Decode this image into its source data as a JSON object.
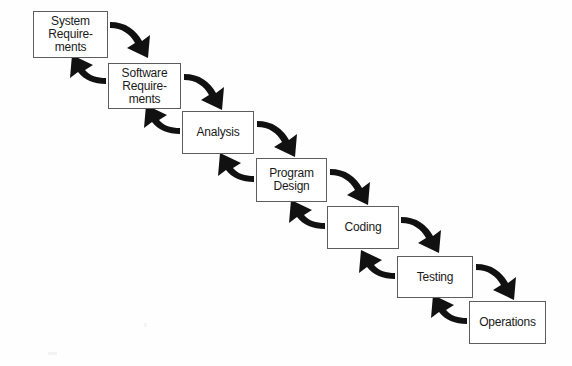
{
  "diagram": {
    "type": "waterfall-model-flowchart",
    "background_color": "#fefefe",
    "box_border_color": "#5d5d5d",
    "arrow_color": "#111111",
    "text_color": "#1a1a1a",
    "stages": [
      {
        "id": "system-requirements",
        "label": "System\nRequire-\nments",
        "x": 33,
        "y": 11,
        "width": 75,
        "height": 47
      },
      {
        "id": "software-requirements",
        "label": "Software\nRequire-\nments",
        "x": 108,
        "y": 63,
        "width": 73,
        "height": 46
      },
      {
        "id": "analysis",
        "label": "Analysis",
        "x": 182,
        "y": 111,
        "width": 72,
        "height": 43
      },
      {
        "id": "program-design",
        "label": "Program\nDesign",
        "x": 256,
        "y": 158,
        "width": 71,
        "height": 44
      },
      {
        "id": "coding",
        "label": "Coding",
        "x": 327,
        "y": 206,
        "width": 72,
        "height": 43
      },
      {
        "id": "testing",
        "label": "Testing",
        "x": 397,
        "y": 256,
        "width": 76,
        "height": 42
      },
      {
        "id": "operations",
        "label": "Operations",
        "x": 469,
        "y": 301,
        "width": 77,
        "height": 43
      }
    ],
    "forward_arrows": [
      {
        "id": "arrow-system-requirements-to-software-requirements",
        "from": "system-requirements",
        "to": "software-requirements"
      },
      {
        "id": "arrow-software-requirements-to-analysis",
        "from": "software-requirements",
        "to": "analysis"
      },
      {
        "id": "arrow-analysis-to-program-design",
        "from": "analysis",
        "to": "program-design"
      },
      {
        "id": "arrow-program-design-to-coding",
        "from": "program-design",
        "to": "coding"
      },
      {
        "id": "arrow-coding-to-testing",
        "from": "coding",
        "to": "testing"
      },
      {
        "id": "arrow-testing-to-operations",
        "from": "testing",
        "to": "operations"
      }
    ],
    "feedback_arrows": [
      {
        "id": "arrow-software-requirements-to-system-requirements",
        "from": "software-requirements",
        "to": "system-requirements"
      },
      {
        "id": "arrow-analysis-to-software-requirements",
        "from": "analysis",
        "to": "software-requirements"
      },
      {
        "id": "arrow-program-design-to-analysis",
        "from": "program-design",
        "to": "analysis"
      },
      {
        "id": "arrow-coding-to-program-design",
        "from": "coding",
        "to": "program-design"
      },
      {
        "id": "arrow-testing-to-coding",
        "from": "testing",
        "to": "coding"
      },
      {
        "id": "arrow-operations-to-testing",
        "from": "operations",
        "to": "testing"
      }
    ]
  }
}
